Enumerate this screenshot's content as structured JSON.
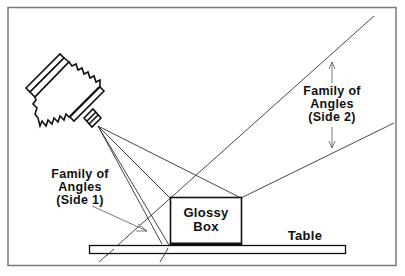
{
  "diagram": {
    "type": "lighting-geometry",
    "frame_color": "#7a7a7a",
    "line_color": "#222222",
    "objects": {
      "camera": {
        "label": ""
      },
      "box": {
        "line1": "Glossy",
        "line2": "Box"
      },
      "table": {
        "label": "Table"
      }
    },
    "annotations": {
      "side1": {
        "line1": "Family of",
        "line2": "Angles",
        "line3": "(Side 1)"
      },
      "side2": {
        "line1": "Family of",
        "line2": "Angles",
        "line3": "(Side 2)"
      }
    }
  }
}
